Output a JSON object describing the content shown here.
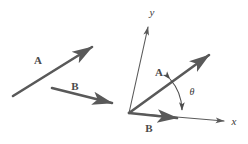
{
  "figure": {
    "background_color": "#ffffff",
    "stroke_color": "#595959",
    "label_color": "#4a4a4a",
    "width": 248,
    "height": 144
  },
  "left_panel": {
    "name": "free-vectors-panel",
    "description": "Vectors A and B drawn in arbitrary positions",
    "vectors": [
      {
        "id": "A",
        "label": "A",
        "label_x": 38,
        "label_y": 64,
        "tail_x": 13,
        "tail_y": 96,
        "head_x": 95,
        "head_y": 45,
        "stroke_width": 2.6
      },
      {
        "id": "B",
        "label": "B",
        "label_x": 75,
        "label_y": 90,
        "tail_x": 52,
        "tail_y": 88,
        "head_x": 115,
        "head_y": 104,
        "stroke_width": 2.6
      }
    ]
  },
  "right_panel": {
    "name": "tail-to-tail-panel",
    "description": "Vectors A and B placed tail-to-tail at the origin of an x-y coordinate frame with angle theta between them",
    "origin_x": 129,
    "origin_y": 113,
    "axes": [
      {
        "id": "y",
        "label": "y",
        "label_x": 150,
        "label_y": 15,
        "tip_x": 149,
        "tip_y": 23,
        "stroke_width": 1.1
      },
      {
        "id": "x",
        "label": "x",
        "label_x": 234,
        "label_y": 125,
        "tip_x": 228,
        "tip_y": 122,
        "stroke_width": 1.1
      }
    ],
    "vectors": [
      {
        "id": "A",
        "label": "A",
        "label_x": 159,
        "label_y": 76,
        "tip_x": 213,
        "tip_y": 52,
        "stroke_width": 2.6
      },
      {
        "id": "B",
        "label": "B",
        "label_x": 149,
        "label_y": 132,
        "tip_x": 181,
        "tip_y": 118,
        "stroke_width": 2.6
      }
    ],
    "angle": {
      "id": "theta",
      "symbol": "θ",
      "label_x": 192,
      "label_y": 95,
      "arc_radius": 48,
      "description": "double-headed arc spanning from vector A to vector B"
    }
  }
}
